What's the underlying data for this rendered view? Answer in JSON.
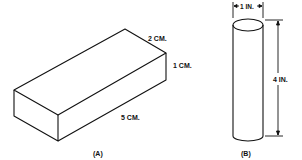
{
  "figure_a": {
    "caption": "(A)",
    "shape": "rectangular-prism",
    "dimensions": {
      "length": "5 CM.",
      "width": "2 CM.",
      "height": "1 CM."
    }
  },
  "figure_b": {
    "caption": "(B)",
    "shape": "cylinder",
    "dimensions": {
      "diameter": "1 IN.",
      "height": "4 IN."
    }
  },
  "colors": {
    "stroke": "#111111",
    "background": "#ffffff"
  }
}
